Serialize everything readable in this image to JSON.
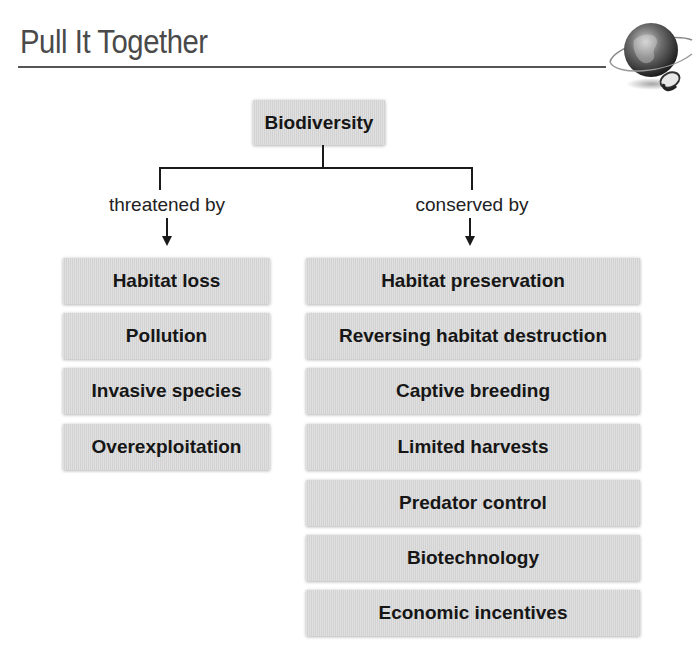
{
  "header": {
    "title": "Pull It Together",
    "icon": "globe-with-mouse-icon"
  },
  "diagram": {
    "root": "Biodiversity",
    "branches": [
      {
        "label": "threatened by",
        "items": [
          "Habitat loss",
          "Pollution",
          "Invasive species",
          "Overexploitation"
        ]
      },
      {
        "label": "conserved by",
        "items": [
          "Habitat preservation",
          "Reversing habitat destruction",
          "Captive breeding",
          "Limited harvests",
          "Predator control",
          "Biotechnology",
          "Economic incentives"
        ]
      }
    ]
  },
  "colors": {
    "box_fill": "#d9d9d9",
    "title_text": "#4a4a4a",
    "line": "#1a1a1a"
  }
}
